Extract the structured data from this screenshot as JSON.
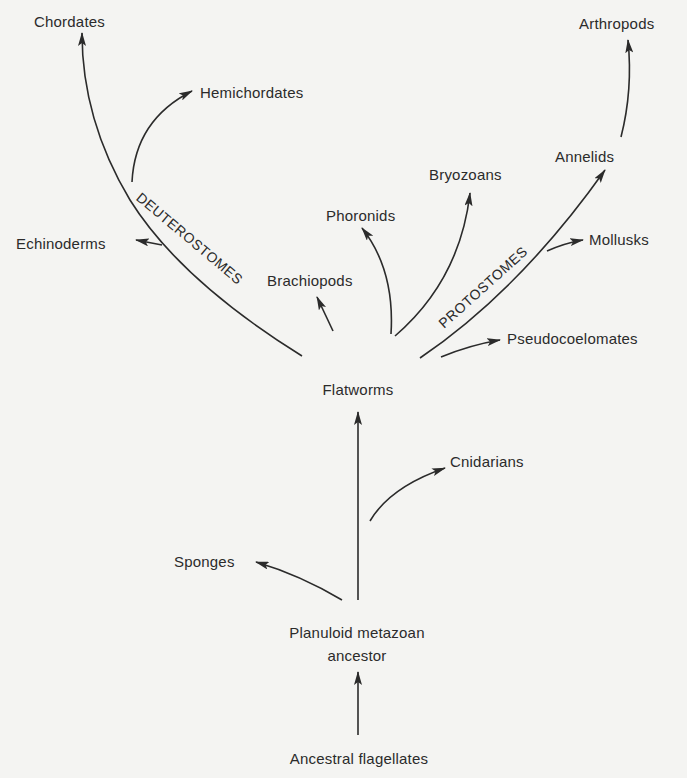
{
  "diagram": {
    "type": "phylogenetic-tree",
    "nodes": {
      "chordates": "Chordates",
      "hemichordates": "Hemichordates",
      "echinoderms": "Echinoderms",
      "brachiopods": "Brachiopods",
      "phoronids": "Phoronids",
      "bryozoans": "Bryozoans",
      "arthropods": "Arthropods",
      "annelids": "Annelids",
      "mollusks": "Mollusks",
      "pseudocoelomates": "Pseudocoelomates",
      "flatworms": "Flatworms",
      "cnidarians": "Cnidarians",
      "sponges": "Sponges",
      "planuloid_line1": "Planuloid metazoan",
      "planuloid_line2": "ancestor",
      "ancestral_flagellates": "Ancestral flagellates"
    },
    "branch_labels": {
      "deuterostomes": "DEUTEROSTOMES",
      "protostomes": "PROTOSTOMES"
    },
    "edges": [
      [
        "ancestral_flagellates",
        "planuloid_metazoan_ancestor"
      ],
      [
        "planuloid_metazoan_ancestor",
        "sponges"
      ],
      [
        "planuloid_metazoan_ancestor",
        "cnidarians"
      ],
      [
        "planuloid_metazoan_ancestor",
        "flatworms"
      ],
      [
        "flatworms",
        "brachiopods"
      ],
      [
        "flatworms",
        "phoronids"
      ],
      [
        "flatworms",
        "bryozoans"
      ],
      [
        "flatworms",
        "pseudocoelomates"
      ],
      [
        "flatworms",
        "deuterostomes"
      ],
      [
        "deuterostomes",
        "echinoderms"
      ],
      [
        "deuterostomes",
        "hemichordates"
      ],
      [
        "deuterostomes",
        "chordates"
      ],
      [
        "flatworms",
        "protostomes"
      ],
      [
        "protostomes",
        "mollusks"
      ],
      [
        "protostomes",
        "annelids"
      ],
      [
        "annelids",
        "arthropods"
      ]
    ],
    "colors": {
      "background": "#f4f4f2",
      "ink": "#2b2b2b"
    }
  }
}
